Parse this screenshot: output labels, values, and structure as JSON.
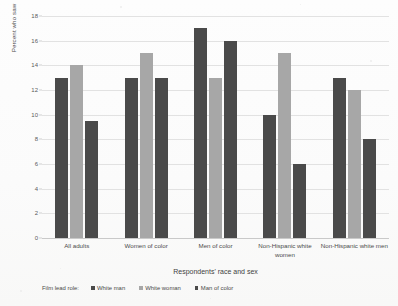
{
  "chart_data": {
    "type": "bar",
    "title": "",
    "xlabel": "Respondents' race and sex",
    "ylabel": "Percent who saw",
    "ylim": [
      0,
      18
    ],
    "yticks": [
      0,
      2,
      4,
      6,
      8,
      10,
      12,
      14,
      16,
      18
    ],
    "grid": true,
    "legend_position": "bottom",
    "legend_title": "Film lead role:",
    "categories": [
      "All adults",
      "Women of color",
      "Men of color",
      "Non-Hispanic white women",
      "Non-Hispanic white men"
    ],
    "series": [
      {
        "name": "White man",
        "color": "#4a4a4a",
        "values": [
          13,
          13,
          17,
          10,
          13
        ]
      },
      {
        "name": "White woman",
        "color": "#a7a7a7",
        "values": [
          14,
          15,
          13,
          15,
          12
        ]
      },
      {
        "name": "Man of color",
        "color": "#4a4a4a",
        "values": [
          9.5,
          13,
          16,
          6,
          8
        ]
      }
    ]
  },
  "colors": {
    "series_white_man": "#4a4a4a",
    "series_white_woman": "#a7a7a7",
    "series_man_of_color": "#4a4a4a",
    "gridline": "#e2e2e2",
    "background": "#ffffff"
  }
}
